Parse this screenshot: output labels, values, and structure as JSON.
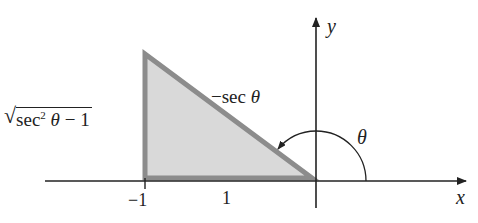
{
  "figure": {
    "axes": {
      "x_label": "x",
      "y_label": "y"
    },
    "triangle": {
      "fill_color": "#d9d9d9",
      "stroke_color": "#8c8c8c",
      "hypotenuse_label_prefix": "−sec ",
      "hypotenuse_label_theta": "θ",
      "vertical_side_label": {
        "sqrt_symbol": "√",
        "radicand_prefix": "sec",
        "exponent": "2",
        "theta": " θ",
        "radicand_suffix": " − 1"
      },
      "base_label": "1"
    },
    "ticks": {
      "neg_one": "−1"
    },
    "angle": {
      "label": "θ"
    },
    "colors": {
      "axis": "#222222",
      "triangle_fill": "#d9d9d9",
      "triangle_stroke": "#8c8c8c"
    }
  }
}
